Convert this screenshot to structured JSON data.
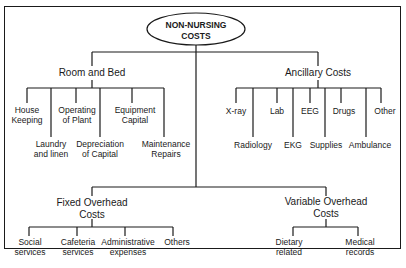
{
  "diagram": {
    "root": {
      "label_line1": "NON-NURSING",
      "label_line2": "COSTS"
    },
    "branches": {
      "room_and_bed": {
        "label": "Room and Bed",
        "children": [
          {
            "line1": "House",
            "line2": "Keeping"
          },
          {
            "line1": "Laundry",
            "line2": "and linen"
          },
          {
            "line1": "Operating",
            "line2": "of Plant"
          },
          {
            "line1": "Depreciation",
            "line2": "of Capital"
          },
          {
            "line1": "Equipment",
            "line2": "Capital"
          },
          {
            "line1": "Maintenance",
            "line2": "Repairs"
          }
        ]
      },
      "ancillary": {
        "label": "Ancillary Costs",
        "children": [
          {
            "line1": "X-ray"
          },
          {
            "line1": "Radiology"
          },
          {
            "line1": "Lab"
          },
          {
            "line1": "EKG"
          },
          {
            "line1": "EEG"
          },
          {
            "line1": "Supplies"
          },
          {
            "line1": "Drugs"
          },
          {
            "line1": "Ambulance"
          },
          {
            "line1": "Other"
          }
        ]
      },
      "fixed_overhead": {
        "label_line1": "Fixed Overhead",
        "label_line2": "Costs",
        "children": [
          {
            "line1": "Social",
            "line2": "services"
          },
          {
            "line1": "Cafeteria",
            "line2": "services"
          },
          {
            "line1": "Administrative",
            "line2": "expenses"
          },
          {
            "line1": "Others"
          }
        ]
      },
      "variable_overhead": {
        "label_line1": "Variable Overhead",
        "label_line2": "Costs",
        "children": [
          {
            "line1": "Dietary",
            "line2": "related"
          },
          {
            "line1": "Medical",
            "line2": "records"
          }
        ]
      }
    }
  }
}
